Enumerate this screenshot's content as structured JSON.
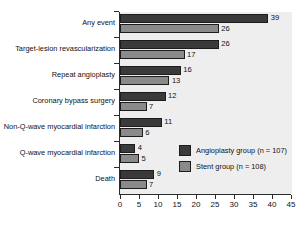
{
  "chart_data": {
    "type": "bar",
    "orientation": "horizontal",
    "title": "",
    "subtitle": "",
    "xlabel": "",
    "ylabel": "",
    "xlim": [
      0,
      45
    ],
    "xticks": [
      "0",
      "5",
      "10",
      "15",
      "20",
      "25",
      "30",
      "35",
      "40",
      "45"
    ],
    "grid": false,
    "legend_position": "inside-lower-right",
    "categories": [
      "Any event",
      "Target-lesion revascularization",
      "Repeat angioplasty",
      "Coronary bypass surgery",
      "Non-Q-wave myocardial infarction",
      "Q-wave myocardial infarction",
      "Death"
    ],
    "series": [
      {
        "name": "Angioplasty group (n = 107)",
        "color": "#3a3a3a",
        "values": [
          39,
          26,
          16,
          12,
          11,
          4,
          9
        ]
      },
      {
        "name": "Stent group (n = 108)",
        "color": "#8a8a8a",
        "values": [
          26,
          17,
          13,
          7,
          6,
          5,
          7
        ]
      }
    ]
  },
  "legend": {
    "entries": [
      {
        "label": "Angioplasty group (n = 107)",
        "color": "#3a3a3a"
      },
      {
        "label": "Stent group (n = 108)",
        "color": "#8a8a8a"
      }
    ]
  },
  "colors": {
    "plot_background": "#eeeeee",
    "figure_background": "#ffffff",
    "axis": "#2b2b2b",
    "series_a": "#3a3a3a",
    "series_b": "#8a8a8a",
    "text": "#111111"
  }
}
